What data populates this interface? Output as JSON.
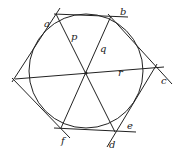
{
  "diagram": {
    "labels": {
      "a": "a",
      "b": "b",
      "c": "c",
      "d": "d",
      "e": "e",
      "f": "f",
      "p": "p",
      "q": "q",
      "r": "r"
    }
  }
}
